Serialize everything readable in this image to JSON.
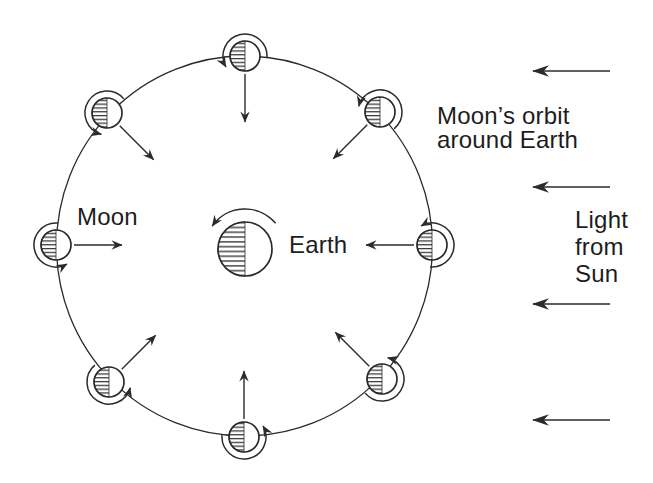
{
  "colors": {
    "ink": "#2b2b2b",
    "background": "#ffffff"
  },
  "labels": {
    "moon": "Moon",
    "earth": "Earth",
    "orbit_caption_line1": "Moon’s orbit",
    "orbit_caption_line2": "around Earth",
    "light_caption_line1": "Light",
    "light_caption_line2": "from",
    "light_caption_line3": "Sun"
  },
  "diagram": {
    "canvas": {
      "width": 653,
      "height": 483
    },
    "orbit": {
      "cx": 244.5,
      "cy": 246,
      "rx": 188,
      "ry": 190
    },
    "earth": {
      "cx": 245,
      "cy": 249,
      "radius": 27,
      "spin_arc": {
        "radius": 40,
        "tail_deg": 40,
        "head_deg": 145
      }
    },
    "moon_radius": 15,
    "moons": [
      {
        "name": "north",
        "x": 245,
        "y": 56,
        "outward_deg": 90
      },
      {
        "name": "northeast",
        "x": 380,
        "y": 112,
        "outward_deg": 45
      },
      {
        "name": "east",
        "x": 432,
        "y": 245,
        "outward_deg": 0
      },
      {
        "name": "southeast",
        "x": 382,
        "y": 379,
        "outward_deg": -45
      },
      {
        "name": "south",
        "x": 244,
        "y": 437,
        "outward_deg": -90
      },
      {
        "name": "southwest",
        "x": 109,
        "y": 382,
        "outward_deg": -135
      },
      {
        "name": "west",
        "x": 56,
        "y": 245,
        "outward_deg": 180
      },
      {
        "name": "northwest",
        "x": 107,
        "y": 113,
        "outward_deg": 135
      }
    ],
    "spin_arc": {
      "radius": 22,
      "tail_offset_deg": -95,
      "head_offset_deg": 120
    },
    "centripetal_arrow": {
      "start_dist": 18,
      "end_dist": 66
    },
    "light_arrows": {
      "x_tail": 610,
      "x_tip": 533,
      "ys": [
        71,
        187,
        304,
        420
      ]
    }
  }
}
